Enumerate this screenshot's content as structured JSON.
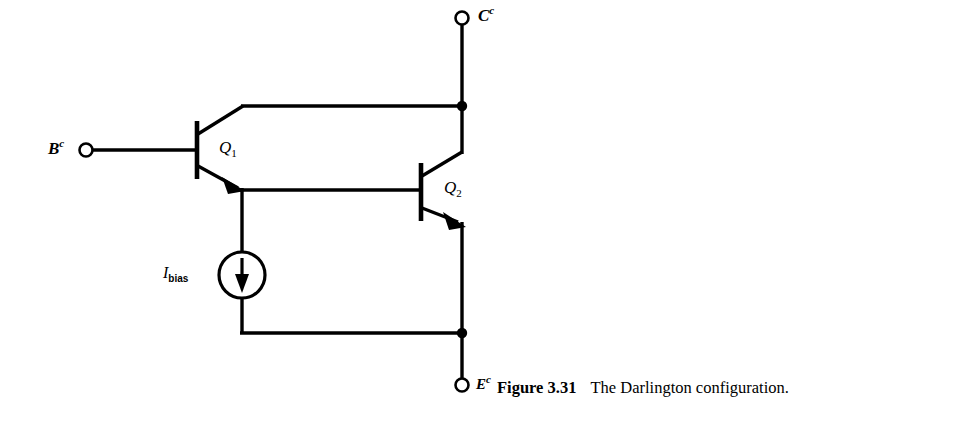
{
  "figure": {
    "caption_label": "Figure 3.31",
    "caption_text": "The Darlington configuration.",
    "line_color": "#000000",
    "background_color": "#ffffff"
  },
  "terminals": [
    {
      "id": "base",
      "letter": "B",
      "superscript": "c",
      "x": 86,
      "y": 150
    },
    {
      "id": "collector",
      "letter": "C",
      "superscript": "c",
      "x": 462,
      "y": 18
    },
    {
      "id": "emitter",
      "letter": "E",
      "superscript": "c",
      "x": 462,
      "y": 385
    }
  ],
  "transistors": [
    {
      "id": "q1",
      "letter": "Q",
      "subscript": "1",
      "type": "npn"
    },
    {
      "id": "q2",
      "letter": "Q",
      "subscript": "2",
      "type": "npn"
    }
  ],
  "current_source": {
    "id": "ibias",
    "letter": "I",
    "subscript": "bias",
    "direction": "down"
  },
  "junctions": [
    {
      "id": "collector-node",
      "x": 462,
      "y": 106
    },
    {
      "id": "emitter-node",
      "x": 462,
      "y": 333
    }
  ]
}
